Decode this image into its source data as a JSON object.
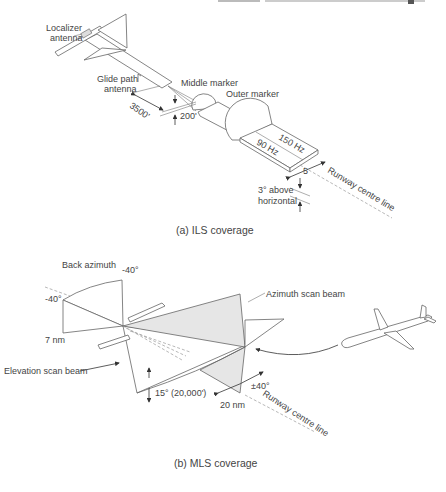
{
  "header": {
    "cropped_text": "... ... ... ..."
  },
  "ils": {
    "caption": "(a) ILS coverage",
    "labels": {
      "localizer_line1": "Localizer",
      "localizer_line2": "antenna",
      "glide_line1": "Glide path",
      "glide_line2": "antenna",
      "middle_marker": "Middle marker",
      "outer_marker": "Outer marker",
      "dist_3500": "3500'",
      "dist_200": "200'",
      "hz150": "150 Hz",
      "hz90": "90 Hz",
      "five": "5",
      "above_line1": "3° above",
      "above_line2": "horizontal",
      "runway": "Runway centre line"
    }
  },
  "mls": {
    "caption": "(b) MLS coverage",
    "labels": {
      "back_azimuth": "Back azimuth",
      "neg40_top": "-40°",
      "neg40_left": "-40°",
      "seven_nm": "7 nm",
      "elevation_beam": "Elevation scan beam",
      "azimuth_beam": "Azimuth scan beam",
      "fifteen": "15° (20,000')",
      "twenty_nm": "20 nm",
      "pm40": "±40°",
      "runway": "Runway centre line"
    }
  }
}
